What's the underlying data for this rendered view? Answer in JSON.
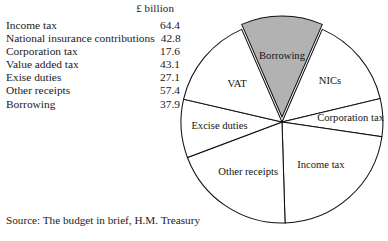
{
  "figure": {
    "unit_header": "£ billion",
    "source_note": "Source: The budget in brief, H.M. Treasury"
  },
  "table": {
    "rows": [
      {
        "label": "Income tax",
        "value": "64.4"
      },
      {
        "label": "National insurance contributions",
        "value": "42.8"
      },
      {
        "label": "Corporation tax",
        "value": "17.6"
      },
      {
        "label": "Value added tax",
        "value": "43.1"
      },
      {
        "label": "Exise duties",
        "value": "27.1"
      },
      {
        "label": "Other receipts",
        "value": "57.4"
      },
      {
        "label": "Borrowing",
        "value": "37.9"
      }
    ]
  },
  "pie_labels": {
    "borrowing": "Borrowing",
    "nics": "NICs",
    "corporation_tax": "Corporation tax",
    "income_tax": "Income tax",
    "other_receipts": "Other receipts",
    "excise_duties": "Excise duties",
    "vat": "VAT"
  },
  "chart_data": {
    "type": "pie",
    "title": "",
    "unit": "£ billion",
    "total": 290.3,
    "legend": "none",
    "grid": false,
    "exploded_slice": "Borrowing",
    "colors": {
      "shaded": "#b2b2b2",
      "plain": "#ffffff",
      "outline": "#111111"
    },
    "categories": [
      "Borrowing",
      "NICs",
      "Corporation tax",
      "Income tax",
      "Other receipts",
      "Excise duties",
      "VAT"
    ],
    "values": [
      37.9,
      42.8,
      17.6,
      64.4,
      57.4,
      27.1,
      43.1
    ],
    "slices": [
      {
        "label": "Borrowing",
        "value": 37.9,
        "percent": 13.1,
        "shaded": true,
        "exploded": true
      },
      {
        "label": "NICs",
        "value": 42.8,
        "percent": 14.7,
        "shaded": false,
        "exploded": false
      },
      {
        "label": "Corporation tax",
        "value": 17.6,
        "percent": 6.1,
        "shaded": false,
        "exploded": false
      },
      {
        "label": "Income tax",
        "value": 64.4,
        "percent": 22.2,
        "shaded": false,
        "exploded": false
      },
      {
        "label": "Other receipts",
        "value": 57.4,
        "percent": 19.8,
        "shaded": false,
        "exploded": false
      },
      {
        "label": "Excise duties",
        "value": 27.1,
        "percent": 9.3,
        "shaded": false,
        "exploded": false
      },
      {
        "label": "VAT",
        "value": 43.1,
        "percent": 14.8,
        "shaded": false,
        "exploded": false
      }
    ],
    "table_rows": [
      {
        "label": "Income tax",
        "value": 64.4
      },
      {
        "label": "National insurance contributions",
        "value": 42.8
      },
      {
        "label": "Corporation tax",
        "value": 17.6
      },
      {
        "label": "Value added tax",
        "value": 43.1
      },
      {
        "label": "Exise duties",
        "value": 27.1
      },
      {
        "label": "Other receipts",
        "value": 57.4
      },
      {
        "label": "Borrowing",
        "value": 37.9
      }
    ],
    "source": "Source: The budget in brief, H.M. Treasury"
  }
}
